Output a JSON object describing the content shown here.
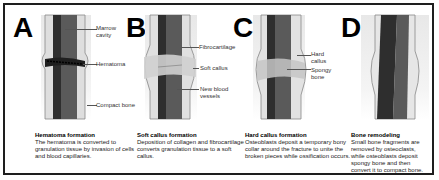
{
  "panels": [
    {
      "letter": "A",
      "labels": [
        "Marrow cavity",
        "Hematoma",
        "Compact bone"
      ],
      "label_lines": [
        [
          "Marrow",
          "cavity"
        ],
        [
          "Hematoma"
        ],
        [
          "Compact bone"
        ]
      ],
      "caption_title": "Hematoma formation",
      "caption_text": "The hematoma is converted to granulation tissue by invasion of cells and blood capillaries."
    },
    {
      "letter": "B",
      "labels": [
        "Fibrocartilage",
        "Soft callus",
        "New blood vessels"
      ],
      "label_lines": [
        [
          "Fibrocartilage"
        ],
        [
          "Soft callus"
        ],
        [
          "New blood",
          "vessels"
        ]
      ],
      "caption_title": "Soft callus formation",
      "caption_text": "Deposition of collagen and fibrocartilage converts granulation tissue to a soft callus."
    },
    {
      "letter": "C",
      "labels": [
        "Hard callus",
        "Spongy bone"
      ],
      "label_lines": [
        [
          "Hard",
          "callus"
        ],
        [
          "Spongy",
          "bone"
        ]
      ],
      "caption_title": "Hard callus formation",
      "caption_text": "Osteoblasts deposit a temporary bony collar around the fracture to unite the broken pieces while ossification occurs."
    },
    {
      "letter": "D",
      "labels": [],
      "label_lines": [],
      "caption_title": "Bone remodeling",
      "caption_text": "Small bone fragments are removed by osteoclasts, while osteoblasts deposit spongy bone and then convert it to compact bone."
    }
  ],
  "colors": {
    "border": "#1e1e1e",
    "marrow": "#4a4a4a",
    "bone_wall": "#d8d8d8",
    "callus": "#c9c9c9",
    "background": "#ffffff"
  }
}
